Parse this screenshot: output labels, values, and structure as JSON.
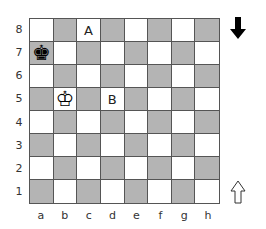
{
  "board": {
    "ranks": [
      "8",
      "7",
      "6",
      "5",
      "4",
      "3",
      "2",
      "1"
    ],
    "files": [
      "a",
      "b",
      "c",
      "d",
      "e",
      "f",
      "g",
      "h"
    ],
    "colors": {
      "light": "#ffffff",
      "dark": "#b4b4b4",
      "border": "#555555"
    },
    "pieces": [
      {
        "square": "a7",
        "type": "king",
        "color": "black",
        "glyph": "♚"
      },
      {
        "square": "b5",
        "type": "king",
        "color": "white",
        "glyph": "♔"
      }
    ],
    "markers": [
      {
        "square": "c8",
        "label": "A"
      },
      {
        "square": "d5",
        "label": "B"
      }
    ]
  },
  "side_to_move": {
    "top_indicator": {
      "icon": "arrow-down-filled-icon",
      "meaning": "black"
    },
    "bottom_indicator": {
      "icon": "arrow-up-outline-icon",
      "meaning": "white"
    }
  }
}
